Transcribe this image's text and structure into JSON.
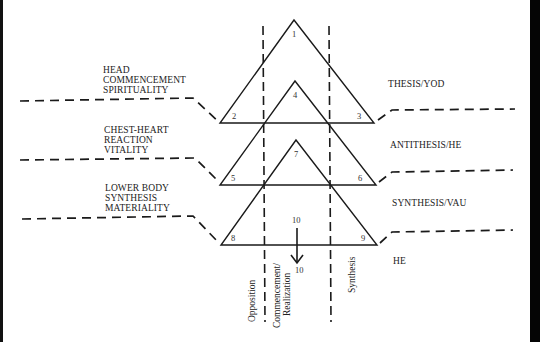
{
  "left_labels": [
    {
      "lines": [
        "HEAD",
        "COMMENCEMENT",
        "SPIRITUALITY"
      ]
    },
    {
      "lines": [
        "CHEST-HEART",
        "REACTION",
        "VITALITY"
      ]
    },
    {
      "lines": [
        "LOWER BODY",
        "SYNTHESIS",
        "MATERIALITY"
      ]
    }
  ],
  "right_labels": [
    "THESIS/YOD",
    "ANTITHESIS/HE",
    "SYNTHESIS/VAU",
    "HE"
  ],
  "vertex_numbers": [
    "1",
    "2",
    "3",
    "4",
    "5",
    "6",
    "7",
    "8",
    "9"
  ],
  "arrow": {
    "from_label": "10",
    "to_label": "10"
  },
  "vertical_labels": {
    "opposition": "Opposition",
    "commencement_line1": "Commencement/",
    "commencement_line2": "Realization",
    "synthesis": "Synthesis"
  },
  "colors": {
    "line": "#1a1a1a",
    "background": "#ffffff",
    "frame": "#0a0a0a"
  }
}
